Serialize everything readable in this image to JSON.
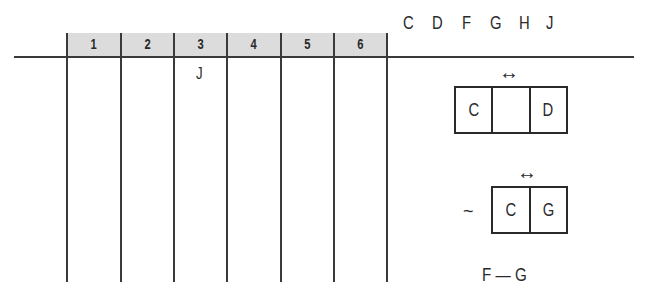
{
  "available_letters": [
    "C",
    "D",
    "F",
    "G",
    "H",
    "J"
  ],
  "slots": {
    "columns": [
      {
        "label": "1",
        "value": ""
      },
      {
        "label": "2",
        "value": ""
      },
      {
        "label": "3",
        "value": "J"
      },
      {
        "label": "4",
        "value": ""
      },
      {
        "label": "5",
        "value": ""
      },
      {
        "label": "6",
        "value": ""
      }
    ]
  },
  "rules": {
    "rule1": {
      "arrow": "↔",
      "cells": [
        "C",
        "",
        "D"
      ]
    },
    "rule2": {
      "prefix": "~",
      "arrow": "↔",
      "cells": [
        "C",
        "G"
      ]
    },
    "rule3": {
      "text": "F — G"
    }
  },
  "colors": {
    "header_fill": "#dcdcdc",
    "line": "#3a3a3a",
    "text": "#2a2a2a"
  }
}
